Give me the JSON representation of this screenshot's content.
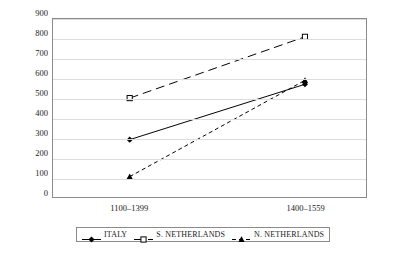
{
  "chart_data": {
    "type": "line",
    "title": "",
    "xlabel": "",
    "ylabel": "Cumulative nos.",
    "categories": [
      "1100–1399",
      "1400–1559"
    ],
    "ylim": [
      0,
      900
    ],
    "ytick_step": 100,
    "yticks": [
      "900",
      "800",
      "700",
      "600",
      "500",
      "400",
      "300",
      "200",
      "100",
      "0"
    ],
    "grid": true,
    "legend_position": "bottom",
    "series": [
      {
        "name": "ITALY",
        "values": [
          290,
          570
        ],
        "marker": "diamond-filled",
        "line_style": "solid",
        "color": "#000000"
      },
      {
        "name": "S. NETHERLANDS",
        "values": [
          500,
          810
        ],
        "marker": "square-open",
        "line_style": "long-dash",
        "color": "#000000"
      },
      {
        "name": "N. NETHERLANDS",
        "values": [
          103,
          590
        ],
        "marker": "triangle-filled",
        "line_style": "short-dash",
        "color": "#000000"
      }
    ]
  },
  "axis": {
    "y_title": "Cumulative nos."
  },
  "legend": {
    "items": [
      {
        "label": "ITALY"
      },
      {
        "label": "S. NETHERLANDS"
      },
      {
        "label": "N. NETHERLANDS"
      }
    ]
  }
}
